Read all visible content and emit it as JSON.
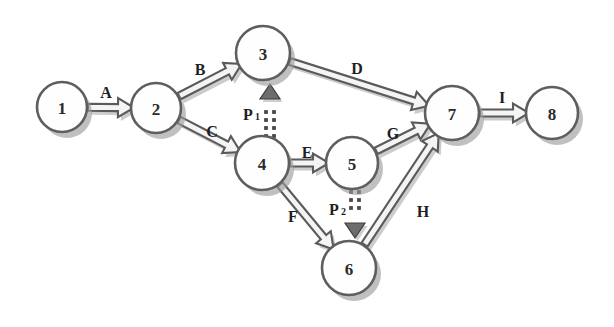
{
  "diagram": {
    "background_color": "#ffffff",
    "node_fill_color": "#fefefe",
    "node_stroke_color": "#5e5e5e",
    "edge_fill_color": "#f4f4f4",
    "edge_stroke_color": "#5a5a5a",
    "shadow_color": "#9a9a9a",
    "label_color": "#1f1f1f"
  },
  "nodes": [
    {
      "id": "1",
      "label": "1",
      "cx": 62,
      "cy": 107,
      "r": 25
    },
    {
      "id": "2",
      "label": "2",
      "cx": 156,
      "cy": 108,
      "r": 25
    },
    {
      "id": "3",
      "label": "3",
      "cx": 263,
      "cy": 53,
      "r": 27
    },
    {
      "id": "4",
      "label": "4",
      "cx": 262,
      "cy": 163,
      "r": 27
    },
    {
      "id": "5",
      "label": "5",
      "cx": 352,
      "cy": 163,
      "r": 26
    },
    {
      "id": "6",
      "label": "6",
      "cx": 349,
      "cy": 268,
      "r": 27
    },
    {
      "id": "7",
      "label": "7",
      "cx": 452,
      "cy": 113,
      "r": 27
    },
    {
      "id": "8",
      "label": "8",
      "cx": 552,
      "cy": 113,
      "r": 26
    }
  ],
  "edges": [
    {
      "id": "A",
      "label": "A",
      "from": "1",
      "to": "2",
      "style": "solid",
      "label_x": 106,
      "label_y": 92
    },
    {
      "id": "B",
      "label": "B",
      "from": "2",
      "to": "3",
      "style": "solid",
      "label_x": 200,
      "label_y": 69
    },
    {
      "id": "C",
      "label": "C",
      "from": "2",
      "to": "4",
      "style": "solid",
      "label_x": 212,
      "label_y": 131
    },
    {
      "id": "D",
      "label": "D",
      "from": "3",
      "to": "7",
      "style": "solid",
      "label_x": 357,
      "label_y": 68
    },
    {
      "id": "E",
      "label": "E",
      "from": "4",
      "to": "5",
      "style": "solid",
      "label_x": 307,
      "label_y": 152
    },
    {
      "id": "F",
      "label": "F",
      "from": "4",
      "to": "6",
      "style": "solid",
      "label_x": 293,
      "label_y": 216
    },
    {
      "id": "G",
      "label": "G",
      "from": "5",
      "to": "7",
      "style": "solid",
      "label_x": 393,
      "label_y": 133
    },
    {
      "id": "H",
      "label": "H",
      "from": "6",
      "to": "7",
      "style": "solid",
      "label_x": 423,
      "label_y": 211
    },
    {
      "id": "I",
      "label": "I",
      "from": "7",
      "to": "8",
      "style": "solid",
      "label_x": 502,
      "label_y": 97
    }
  ],
  "dotted_edges": [
    {
      "id": "P1",
      "label": "P",
      "subscript": "1",
      "from": "4",
      "to": "3",
      "direction": "up",
      "style": "dotted-double",
      "label_x": 248,
      "label_y": 114,
      "line_x": 270,
      "y_start": 136,
      "y_end": 84
    },
    {
      "id": "P2",
      "label": "P",
      "subscript": "2",
      "from": "5",
      "to": "6",
      "direction": "down",
      "style": "dotted-double",
      "label_x": 334,
      "label_y": 209,
      "line_x": 355,
      "y_start": 192,
      "y_end": 238
    }
  ]
}
